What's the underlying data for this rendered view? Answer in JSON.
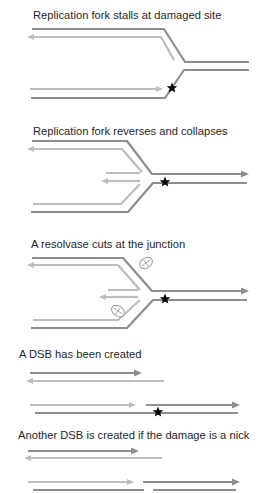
{
  "figure": {
    "colors": {
      "parental_strand": "#8e8e8e",
      "nascent_strand": "#bdbdbd",
      "damage_marker": "#000000",
      "text": "#1f1f1f"
    },
    "panels": [
      {
        "title": "Replication fork stalls at damaged site"
      },
      {
        "title": "Replication fork reverses and collapses"
      },
      {
        "title": "A resolvase cuts at the junction"
      },
      {
        "title": "A DSB has been created"
      },
      {
        "title": "Another DSB is created if the damage is a nick"
      }
    ],
    "icons": {
      "damage": "star-icon",
      "resolvase": "resolvase-icon"
    }
  }
}
